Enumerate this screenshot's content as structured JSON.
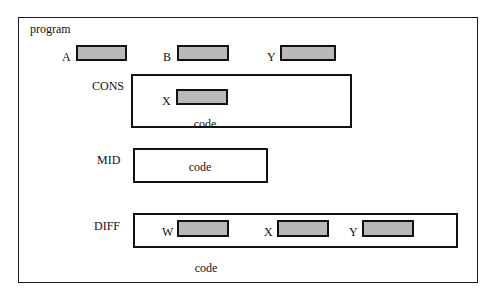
{
  "diagram": {
    "outer_block": {
      "label": "program",
      "frame": {
        "x": 18,
        "y": 17,
        "w": 460,
        "h": 266
      }
    },
    "top_level_slots": [
      {
        "label": "A",
        "label_x": 62,
        "label_y": 51,
        "x": 76,
        "y": 45,
        "w": 51,
        "h": 16
      },
      {
        "label": "B",
        "label_x": 163,
        "label_y": 51,
        "x": 177,
        "y": 45,
        "w": 52,
        "h": 16
      },
      {
        "label": "Y",
        "label_x": 267,
        "label_y": 51,
        "x": 280,
        "y": 45,
        "w": 56,
        "h": 16
      }
    ],
    "code_blocks": [
      {
        "name": "CONS",
        "label_x": 92,
        "label_y": 80,
        "frame": {
          "x": 131,
          "y": 74,
          "w": 221,
          "h": 54
        },
        "caption": "code",
        "caption_x": 160,
        "caption_y": 118,
        "caption_w": 90,
        "slots": [
          {
            "label": "X",
            "label_x": 162,
            "label_y": 95,
            "x": 176,
            "y": 89,
            "w": 52,
            "h": 16
          }
        ]
      },
      {
        "name": "MID",
        "label_x": 97,
        "label_y": 154,
        "frame": {
          "x": 133,
          "y": 148,
          "w": 135,
          "h": 35
        },
        "caption": "code",
        "caption_x": 155,
        "caption_y": 161,
        "caption_w": 90,
        "slots": []
      },
      {
        "name": "DIFF",
        "label_x": 94,
        "label_y": 220,
        "frame": {
          "x": 133,
          "y": 213,
          "w": 325,
          "h": 35
        },
        "caption": "code",
        "caption_x": 161,
        "caption_y": 262,
        "caption_w": 90,
        "slots": [
          {
            "label": "W",
            "label_x": 162,
            "label_y": 226,
            "x": 177,
            "y": 220,
            "w": 52,
            "h": 17
          },
          {
            "label": "X",
            "label_x": 264,
            "label_y": 226,
            "x": 277,
            "y": 220,
            "w": 52,
            "h": 17
          },
          {
            "label": "Y",
            "label_x": 349,
            "label_y": 226,
            "x": 362,
            "y": 220,
            "w": 52,
            "h": 17
          }
        ]
      }
    ],
    "colors": {
      "slot_fill": "#b9b9b9",
      "stroke": "#111111",
      "background": "#ffffff"
    }
  }
}
